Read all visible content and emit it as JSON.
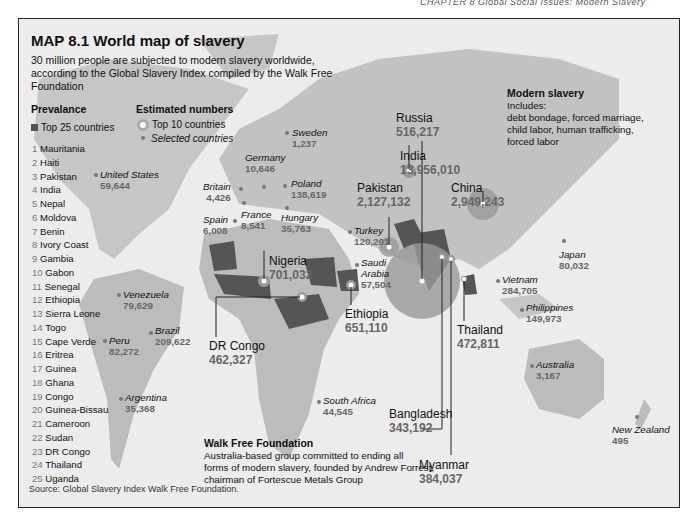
{
  "page": {
    "running_head": "CHAPTER 8 Global Social Issues: Modern Slavery"
  },
  "map": {
    "title": "MAP 8.1 World map of slavery",
    "subtitle": "30 million people are subjected to modern slavery worldwide, according to the Global Slavery Index compiled by the Walk Free Foundation",
    "source_label": "Source:",
    "source_text": "Global Slavery Index Walk Free Foundation.",
    "colors": {
      "background": "#ececec",
      "land": "#bdbdbd",
      "top25_fill": "#555555",
      "top10_circle": "#9a9a9a",
      "value_text": "#666666"
    }
  },
  "legend": {
    "prevalence_heading": "Prevalance",
    "prevalence_item": "Top 25 countries",
    "estimated_heading": "Estimated numbers",
    "top10_item": "Top 10 countries",
    "selected_item": "Selected countries"
  },
  "prevalence_ranking": [
    {
      "rank": "1",
      "country": "Mauritania"
    },
    {
      "rank": "2",
      "country": "Haiti"
    },
    {
      "rank": "3",
      "country": "Pakistan"
    },
    {
      "rank": "4",
      "country": "India"
    },
    {
      "rank": "5",
      "country": "Nepal"
    },
    {
      "rank": "6",
      "country": "Moldova"
    },
    {
      "rank": "7",
      "country": "Benin"
    },
    {
      "rank": "8",
      "country": "Ivory Coast"
    },
    {
      "rank": "9",
      "country": "Gambia"
    },
    {
      "rank": "10",
      "country": "Gabon"
    },
    {
      "rank": "11",
      "country": "Senegal"
    },
    {
      "rank": "12",
      "country": "Ethiopia"
    },
    {
      "rank": "13",
      "country": "Sierra Leone"
    },
    {
      "rank": "14",
      "country": "Togo"
    },
    {
      "rank": "15",
      "country": "Cape Verde"
    },
    {
      "rank": "16",
      "country": "Eritrea"
    },
    {
      "rank": "17",
      "country": "Guinea"
    },
    {
      "rank": "18",
      "country": "Ghana"
    },
    {
      "rank": "19",
      "country": "Congo"
    },
    {
      "rank": "20",
      "country": "Guinea-Bissau"
    },
    {
      "rank": "21",
      "country": "Cameroon"
    },
    {
      "rank": "22",
      "country": "Sudan"
    },
    {
      "rank": "23",
      "country": "DR Congo"
    },
    {
      "rank": "24",
      "country": "Thailand"
    },
    {
      "rank": "25",
      "country": "Uganda"
    }
  ],
  "top10": {
    "india": {
      "name": "India",
      "value": "13,956,010"
    },
    "china": {
      "name": "China",
      "value": "2,949,243"
    },
    "pakistan": {
      "name": "Pakistan",
      "value": "2,127,132"
    },
    "nigeria": {
      "name": "Nigeria",
      "value": "701,032"
    },
    "ethiopia": {
      "name": "Ethiopia",
      "value": "651,110"
    },
    "russia": {
      "name": "Russia",
      "value": "516,217"
    },
    "thailand": {
      "name": "Thailand",
      "value": "472,811"
    },
    "drcongo": {
      "name": "DR Congo",
      "value": "462,327"
    },
    "myanmar": {
      "name": "Myanmar",
      "value": "384,037"
    },
    "bangladesh": {
      "name": "Bangladesh",
      "value": "343,192"
    }
  },
  "selected": {
    "united_states": {
      "name": "United States",
      "value": "59,644"
    },
    "venezuela": {
      "name": "Venezuela",
      "value": "79,629"
    },
    "peru": {
      "name": "Peru",
      "value": "82,272"
    },
    "brazil": {
      "name": "Brazil",
      "value": "209,622"
    },
    "argentina": {
      "name": "Argentina",
      "value": "35,368"
    },
    "britain": {
      "name": "Britain",
      "value": "4,426"
    },
    "spain": {
      "name": "Spain",
      "value": "6,008"
    },
    "france": {
      "name": "France",
      "value": "8,541"
    },
    "germany": {
      "name": "Germany",
      "value": "10,646"
    },
    "sweden": {
      "name": "Sweden",
      "value": "1,237"
    },
    "poland": {
      "name": "Poland",
      "value": "138,619"
    },
    "hungary": {
      "name": "Hungary",
      "value": "35,763"
    },
    "turkey": {
      "name": "Turkey",
      "value": "120,201"
    },
    "saudi_arabia": {
      "name": "Saudi Arabia",
      "name_line1": "Saudi",
      "name_line2": "Arabia",
      "value": "57,504"
    },
    "south_africa": {
      "name": "South Africa",
      "value": "44,545"
    },
    "japan": {
      "name": "Japan",
      "value": "80,032"
    },
    "vietnam": {
      "name": "Vietnam",
      "value": "284,705"
    },
    "philippines": {
      "name": "Philippines",
      "value": "149,973"
    },
    "australia": {
      "name": "Australia",
      "value": "3,167"
    },
    "new_zealand": {
      "name": "New Zealand",
      "value": "495"
    }
  },
  "modern_slavery_box": {
    "heading": "Modern slavery",
    "line1": "Includes:",
    "line2": "debt bondage, forced marriage,",
    "line3": "child labor, human trafficking,",
    "line4": "forced labor"
  },
  "walk_free_box": {
    "heading": "Walk Free Foundation",
    "line1": "Australia-based group committed to ending all",
    "line2": "forms of modern slavery, founded by Andrew Forrest,",
    "line3": "chairman of Fortescue Metals Group"
  }
}
